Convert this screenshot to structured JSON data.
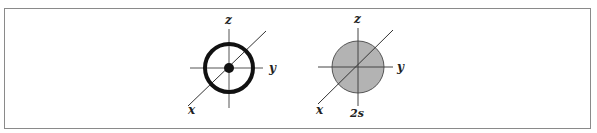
{
  "figure": {
    "left_diagram": {
      "axis_labels": {
        "x": "x",
        "y": "y",
        "z": "z"
      },
      "description": "orbital ring with central nucleus"
    },
    "right_diagram": {
      "axis_labels": {
        "x": "x",
        "y": "y",
        "z": "z"
      },
      "orbital_label": "2s",
      "fill_color": "#b3b3b3"
    },
    "colors": {
      "line": "#333333",
      "border": "#8a8a8a"
    }
  }
}
